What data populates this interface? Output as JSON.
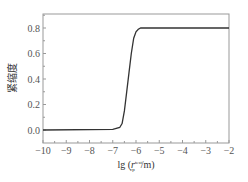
{
  "chart_data": {
    "type": "line",
    "title": "",
    "xlabel": "lg (r_cp^test/m)",
    "xlabel_main": "lg (",
    "xlabel_var": "r",
    "xlabel_sup": "test",
    "xlabel_sub": "cp",
    "xlabel_end": "/m)",
    "ylabel": "紧缩度",
    "xlim": [
      -10,
      -2
    ],
    "ylim": [
      -0.15,
      0.9
    ],
    "xticks": [
      "-10",
      "-9",
      "-8",
      "-7",
      "-6",
      "-5",
      "-4",
      "-3",
      "-2"
    ],
    "yticks": [
      "0.0",
      "0.2",
      "0.4",
      "0.6",
      "0.8"
    ],
    "grid": false,
    "series": [
      {
        "name": "紧缩度",
        "x": [
          -10,
          -7.0,
          -6.7,
          -6.6,
          -6.5,
          -6.4,
          -6.3,
          -6.2,
          -6.1,
          -6.0,
          -5.9,
          -5.8,
          -5.6,
          -5.0,
          -2
        ],
        "values": [
          0.0,
          0.005,
          0.02,
          0.05,
          0.15,
          0.3,
          0.45,
          0.6,
          0.72,
          0.77,
          0.79,
          0.8,
          0.8,
          0.8,
          0.8
        ]
      }
    ]
  }
}
